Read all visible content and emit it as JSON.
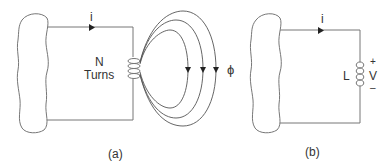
{
  "figure_a": {
    "current_label": "i",
    "turns_label_line1": "N",
    "turns_label_line2": "Turns",
    "flux_label": "ϕ",
    "caption": "(a)"
  },
  "figure_b": {
    "current_label": "i",
    "inductor_label": "L",
    "voltage_label": "V",
    "plus_label": "+",
    "minus_label": "–",
    "caption": "(b)"
  },
  "colors": {
    "line": "#777777",
    "text": "#333333",
    "arrow": "#222222"
  }
}
